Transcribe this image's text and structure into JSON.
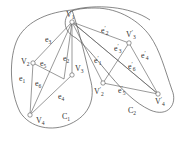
{
  "diagram": {
    "colors": {
      "stroke": "#555555",
      "text": "#333333",
      "background": "#ffffff"
    },
    "regions": [
      {
        "id": "C1",
        "label": "C",
        "subscript": "1"
      },
      {
        "id": "C2",
        "label": "C",
        "subscript": "2"
      }
    ],
    "nodes": [
      {
        "id": "V1",
        "label": "V",
        "subscript": "1",
        "prime": ""
      },
      {
        "id": "V2",
        "label": "V",
        "subscript": "2",
        "prime": ""
      },
      {
        "id": "V3",
        "label": "V",
        "subscript": "3",
        "prime": ""
      },
      {
        "id": "V4",
        "label": "V",
        "subscript": "4",
        "prime": ""
      },
      {
        "id": "V2p",
        "label": "V",
        "subscript": "2",
        "prime": "′"
      },
      {
        "id": "V3p",
        "label": "V",
        "subscript": "3",
        "prime": "′"
      },
      {
        "id": "V4p",
        "label": "V",
        "subscript": "4",
        "prime": "′"
      }
    ],
    "edges": [
      {
        "id": "e1",
        "label": "e",
        "subscript": "1",
        "prime": ""
      },
      {
        "id": "e2",
        "label": "e",
        "subscript": "2",
        "prime": ""
      },
      {
        "id": "e3",
        "label": "e",
        "subscript": "3",
        "prime": ""
      },
      {
        "id": "e4",
        "label": "e",
        "subscript": "4",
        "prime": ""
      },
      {
        "id": "e5",
        "label": "e",
        "subscript": "5",
        "prime": ""
      },
      {
        "id": "e6",
        "label": "e",
        "subscript": "6",
        "prime": ""
      },
      {
        "id": "e1p",
        "label": "e",
        "subscript": "1",
        "prime": "′"
      },
      {
        "id": "e2p",
        "label": "e",
        "subscript": "2",
        "prime": "′"
      },
      {
        "id": "e3p",
        "label": "e",
        "subscript": "3",
        "prime": "′"
      },
      {
        "id": "e4p",
        "label": "e",
        "subscript": "4",
        "prime": "′"
      },
      {
        "id": "e5p",
        "label": "e",
        "subscript": "5",
        "prime": "′"
      },
      {
        "id": "e6p",
        "label": "e",
        "subscript": "6",
        "prime": "′"
      }
    ]
  }
}
